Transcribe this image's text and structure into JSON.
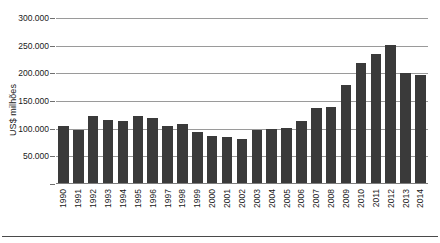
{
  "chart_data": {
    "type": "bar",
    "title": "",
    "xlabel": "",
    "ylabel": "US$ milhões",
    "ylim": [
      0,
      300000
    ],
    "ytick_step": 50000,
    "ytick_labels": [
      "300.000",
      "250.000",
      "200.000",
      "150.000",
      "100.000",
      "50.000"
    ],
    "ytick_values": [
      300000,
      250000,
      200000,
      150000,
      100000,
      50000
    ],
    "grid": true,
    "legend": null,
    "bar_color": "#3a3a3a",
    "categories": [
      "1990",
      "1991",
      "1992",
      "1993",
      "1994",
      "1995",
      "1996",
      "1997",
      "1998",
      "1999",
      "2000",
      "2001",
      "2002",
      "2003",
      "2004",
      "2005",
      "2006",
      "2007",
      "2008",
      "2009",
      "2010",
      "2011",
      "2012",
      "2013",
      "2014"
    ],
    "values": [
      103000,
      96000,
      122000,
      114000,
      112000,
      121000,
      118000,
      103000,
      106000,
      92000,
      85000,
      83000,
      80000,
      95000,
      97000,
      99000,
      112000,
      136000,
      138000,
      178000,
      216000,
      233000,
      250000,
      199000,
      196000
    ]
  },
  "axis": {
    "y_title": "US$ milhões"
  }
}
